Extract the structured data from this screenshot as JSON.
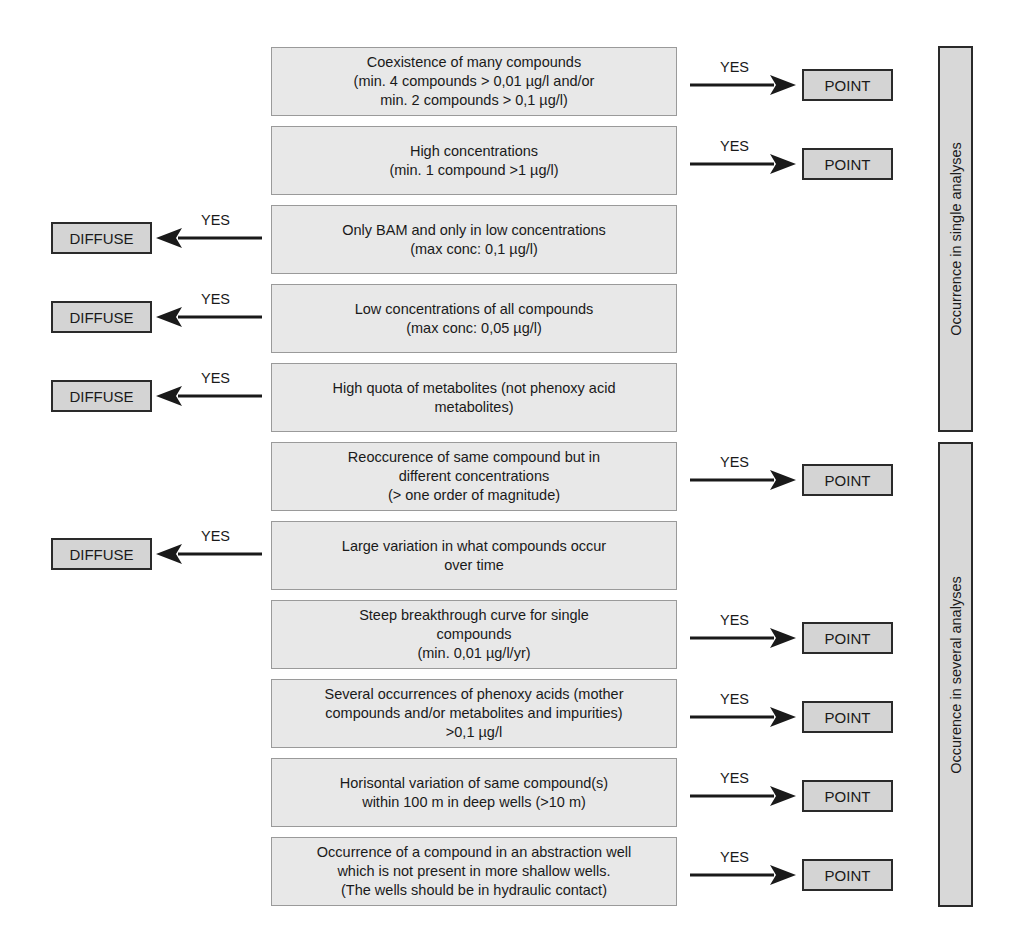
{
  "criteria": [
    {
      "text": "Coexistence of many compounds\n(min. 4 compounds > 0,01 µg/l and/or\nmin. 2 compounds > 0,1 µg/l)",
      "top": 47,
      "outcome": "POINT",
      "direction": "right",
      "yes": "YES"
    },
    {
      "text": "High concentrations\n(min. 1 compound >1 µg/l)",
      "top": 126,
      "outcome": "POINT",
      "direction": "right",
      "yes": "YES"
    },
    {
      "text": "Only BAM and only in low concentrations\n(max conc: 0,1 µg/l)",
      "top": 205,
      "outcome": "DIFFUSE",
      "direction": "left",
      "yes": "YES"
    },
    {
      "text": "Low concentrations of all compounds\n(max conc: 0,05 µg/l)",
      "top": 284,
      "outcome": "DIFFUSE",
      "direction": "left",
      "yes": "YES"
    },
    {
      "text": "High quota of metabolites (not phenoxy acid\nmetabolites)",
      "top": 363,
      "outcome": "DIFFUSE",
      "direction": "left",
      "yes": "YES"
    },
    {
      "text": "Reoccurence of same compound but in\ndifferent concentrations\n(> one order of magnitude)",
      "top": 442,
      "outcome": "POINT",
      "direction": "right",
      "yes": "YES"
    },
    {
      "text": "Large variation in what compounds occur\nover time",
      "top": 521,
      "outcome": "DIFFUSE",
      "direction": "left",
      "yes": "YES"
    },
    {
      "text": "Steep breakthrough curve for single\ncompounds\n(min. 0,01 µg/l/yr)",
      "top": 600,
      "outcome": "POINT",
      "direction": "right",
      "yes": "YES"
    },
    {
      "text": "Several occurrences of phenoxy acids (mother\ncompounds and/or metabolites and impurities)\n>0,1 µg/l",
      "top": 679,
      "outcome": "POINT",
      "direction": "right",
      "yes": "YES"
    },
    {
      "text": "Horisontal variation of same compound(s)\nwithin 100 m in deep wells (>10 m)",
      "top": 758,
      "outcome": "POINT",
      "direction": "right",
      "yes": "YES"
    },
    {
      "text": "Occurrence of a compound in an abstraction well\nwhich is not present in more shallow wells.\n(The wells should be in hydraulic contact)",
      "top": 837,
      "outcome": "POINT",
      "direction": "right",
      "yes": "YES"
    }
  ],
  "sections": [
    {
      "label": "Occurrence in single analyses",
      "top": 46,
      "height": 386
    },
    {
      "label": "Occurence in several analyses",
      "top": 442,
      "height": 465
    }
  ],
  "colors": {
    "criterion_fill": "#e8e8e8",
    "outcome_fill": "#d4d4d4",
    "section_fill": "#d8d8d8",
    "stroke": "#2a2a2a"
  }
}
